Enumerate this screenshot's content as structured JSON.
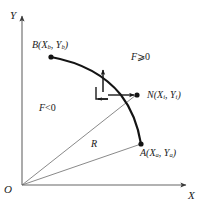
{
  "figure": {
    "background_color": "#ffffff",
    "stroke_color": "#1a1a1a",
    "axis_color": "#555555",
    "width": 203,
    "height": 209
  },
  "axes": {
    "y_label": "Y",
    "x_label": "X",
    "origin_label": "O"
  },
  "points": [
    {
      "id": "B",
      "name": "B",
      "label_full": "B(Xb, Yb)",
      "letter": "B",
      "coord_x_var": "X",
      "coord_x_sub": "b",
      "coord_y_var": "Y",
      "coord_y_sub": "b",
      "px": 51,
      "py": 57
    },
    {
      "id": "N",
      "name": "N",
      "label_full": "N(Xi, Yi)",
      "letter": "N",
      "coord_x_var": "X",
      "coord_x_sub": "i",
      "coord_y_var": "Y",
      "coord_y_sub": "i",
      "px": 137,
      "py": 95
    },
    {
      "id": "A",
      "name": "A",
      "label_full": "A(Xa, Ya)",
      "letter": "A",
      "coord_x_var": "X",
      "coord_x_sub": "a",
      "coord_y_var": "Y",
      "coord_y_sub": "a",
      "px": 141,
      "py": 144
    },
    {
      "id": "O",
      "name": "Origin",
      "label_full": "O",
      "px": 22,
      "py": 185
    }
  ],
  "regions": [
    {
      "id": "positive",
      "var": "F",
      "relation": "⩾",
      "value": "0",
      "label_full": "F ⩾ 0"
    },
    {
      "id": "negative",
      "var": "F",
      "relation": "<",
      "value": "0",
      "label_full": "F < 0"
    }
  ],
  "radius": {
    "label": "R",
    "description": "radius line from origin O to point A"
  },
  "vectors": {
    "normal_arrow": "up-arrow-normal",
    "tangent_arrow": "right-arrow-to-N",
    "inward_arrow": "left-arrow-small"
  },
  "colors": {
    "stroke": "#1a1a1a",
    "axis": "#555555",
    "thin_line": "#6b6b6b"
  }
}
